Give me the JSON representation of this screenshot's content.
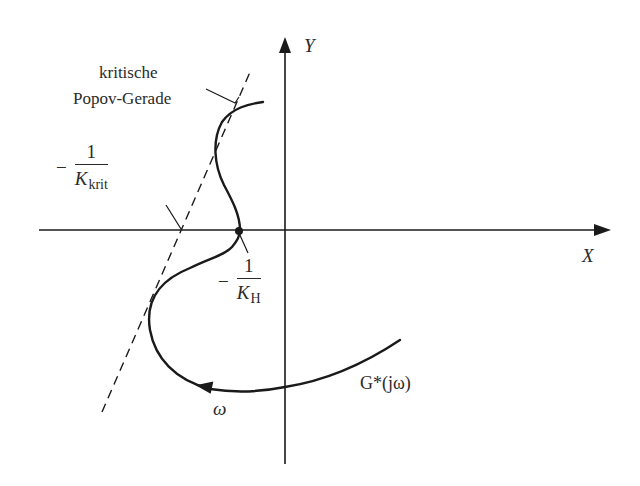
{
  "diagram": {
    "type": "popov-stability-plot",
    "axes": {
      "x_label": "X",
      "y_label": "Y"
    },
    "labels": {
      "popov_line_line1": "kritische",
      "popov_line_line2": "Popov-Gerade",
      "k_krit": {
        "sign": "−",
        "numerator": "1",
        "denominator_main": "K",
        "denominator_sub": "krit"
      },
      "k_h": {
        "sign": "−",
        "numerator": "1",
        "denominator_main": "K",
        "denominator_sub": "H"
      },
      "curve_name": "G*(jω)",
      "frequency_direction": "ω"
    },
    "colors": {
      "line": "#1a1a1a",
      "text": "#2a2a2a",
      "background": "#ffffff"
    }
  }
}
